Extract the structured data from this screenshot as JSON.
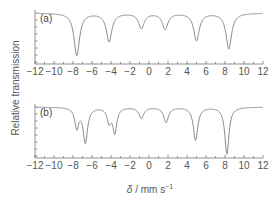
{
  "chart_data": [
    {
      "type": "line",
      "panel_label": "(a)",
      "xlabel": "δ / mm s⁻¹",
      "ylabel": "Relative transmission",
      "xlim": [
        -12,
        12
      ],
      "xticks": [
        -12,
        -10,
        -8,
        -6,
        -4,
        -2,
        0,
        2,
        4,
        6,
        8,
        10,
        12
      ],
      "grid": false,
      "baseline": 1.0,
      "peaks": [
        {
          "position": -7.6,
          "depth": 0.9,
          "width": 0.35
        },
        {
          "position": -4.2,
          "depth": 0.6,
          "width": 0.35
        },
        {
          "position": -0.8,
          "depth": 0.32,
          "width": 0.35
        },
        {
          "position": 1.7,
          "depth": 0.34,
          "width": 0.35
        },
        {
          "position": 5.0,
          "depth": 0.58,
          "width": 0.35
        },
        {
          "position": 8.4,
          "depth": 0.76,
          "width": 0.35
        }
      ]
    },
    {
      "type": "line",
      "panel_label": "(b)",
      "xlabel": "δ / mm s⁻¹",
      "ylabel": "Relative transmission",
      "xlim": [
        -12,
        12
      ],
      "xticks": [
        -12,
        -10,
        -8,
        -6,
        -4,
        -2,
        0,
        2,
        4,
        6,
        8,
        10,
        12
      ],
      "grid": false,
      "baseline": 1.0,
      "peaks": [
        {
          "position": -7.6,
          "depth": 0.4,
          "width": 0.25
        },
        {
          "position": -6.7,
          "depth": 0.7,
          "width": 0.28
        },
        {
          "position": -4.2,
          "depth": 0.28,
          "width": 0.25
        },
        {
          "position": -3.6,
          "depth": 0.5,
          "width": 0.25
        },
        {
          "position": -0.8,
          "depth": 0.22,
          "width": 0.3
        },
        {
          "position": 1.8,
          "depth": 0.3,
          "width": 0.3
        },
        {
          "position": 4.9,
          "depth": 0.66,
          "width": 0.28
        },
        {
          "position": 8.2,
          "depth": 0.94,
          "width": 0.26
        }
      ]
    }
  ],
  "labels": {
    "panel_a": "(a)",
    "panel_b": "(b)",
    "ylabel": "Relative transmission",
    "xlabel_symbol": "δ",
    "xlabel_units": " / mm s",
    "xlabel_exp": "−1"
  },
  "tick_labels": [
    "−12",
    "−10",
    "−8",
    "−6",
    "−4",
    "−2",
    "0",
    "2",
    "4",
    "6",
    "8",
    "10",
    "12"
  ]
}
